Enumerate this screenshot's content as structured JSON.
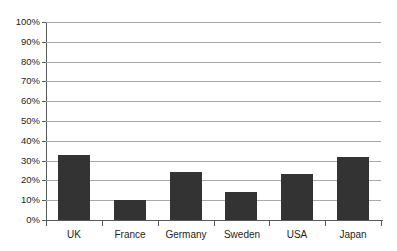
{
  "chart_data": {
    "type": "bar",
    "title": "",
    "xlabel": "",
    "ylabel": "",
    "categories": [
      "UK",
      "France",
      "Germany",
      "Sweden",
      "USA",
      "Japan"
    ],
    "values": [
      33,
      10,
      24,
      14,
      23,
      32
    ],
    "value_labels": [
      "33%",
      "10%",
      "24%",
      "14%",
      "23%",
      "32%"
    ],
    "ylim": [
      0,
      100
    ],
    "ytick_labels": [
      "100%",
      "90%",
      "80%",
      "70%",
      "60%",
      "50%",
      "40%",
      "30%",
      "20%",
      "10%",
      "0%"
    ],
    "ytick_values": [
      100,
      90,
      80,
      70,
      60,
      50,
      40,
      30,
      20,
      10,
      0
    ],
    "grid": true,
    "grid_axis": "y",
    "legend": false,
    "legend_position": "none",
    "bar_color": "#333333",
    "gridline_color": "#a7a9ac",
    "axis_color": "#58595b",
    "text_color": "#231f20",
    "background": "#ffffff"
  },
  "title_fragment": ""
}
